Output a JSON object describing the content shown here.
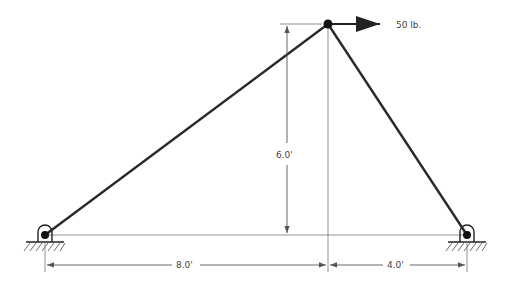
{
  "diagram": {
    "type": "truss-free-body",
    "colors": {
      "member": "#2a2a2a",
      "dimension": "#555555",
      "background": "#ffffff"
    },
    "joints": {
      "apex": {
        "x": 328,
        "y": 24
      },
      "left_support": {
        "x": 45,
        "y": 235
      },
      "right_support": {
        "x": 467,
        "y": 235
      }
    },
    "load": {
      "label": "50 lb.",
      "direction": "right",
      "magnitude": 50,
      "unit": "lb."
    },
    "dimensions": {
      "height_label": "6.0'",
      "left_span_label": "8.0'",
      "right_span_label": "4.0'"
    }
  }
}
